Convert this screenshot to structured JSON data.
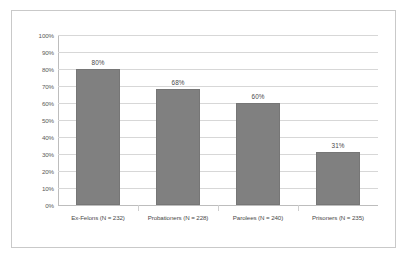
{
  "chart_data": {
    "type": "bar",
    "title": "",
    "xlabel": "",
    "ylabel": "",
    "ylim": [
      0,
      100
    ],
    "grid": true,
    "legend": "none",
    "categories": [
      "Ex-Felons (N = 232)",
      "Probationers (N = 228)",
      "Parolees (N = 240)",
      "Prisoners (N = 235)"
    ],
    "values": [
      80,
      68,
      60,
      31
    ],
    "value_labels": [
      "80%",
      "68%",
      "60%",
      "31%"
    ],
    "ytick_labels": [
      "100%",
      "90%",
      "80%",
      "70%",
      "60%",
      "50%",
      "40%",
      "30%",
      "20%",
      "10%",
      "0%"
    ],
    "ytick_values": [
      100,
      90,
      80,
      70,
      60,
      50,
      40,
      30,
      20,
      10,
      0
    ],
    "series": [
      {
        "name": "",
        "values": [
          80,
          68,
          60,
          31
        ]
      }
    ],
    "colors": {
      "bar_fill": "#808080",
      "bar_border": "#767676",
      "gridline": "#d7d7d7",
      "axis": "#bdbdbd",
      "text": "#4a4a4a",
      "frame": "#c9c9c9",
      "background": "#ffffff"
    }
  }
}
